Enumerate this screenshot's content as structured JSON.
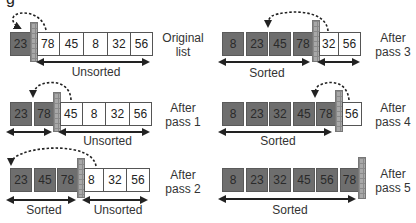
{
  "diagram": {
    "type": "selection sort passes",
    "top_clipped_text": "g",
    "rows": [
      {
        "id": "original",
        "label_line1": "Original",
        "label_line2": "list",
        "values": [
          "23",
          "78",
          "45",
          "8",
          "32",
          "56"
        ],
        "sorted_count": 1,
        "sorted_caption": "",
        "unsorted_caption": "Unsorted"
      },
      {
        "id": "pass1",
        "label_line1": "After",
        "label_line2": "pass 1",
        "values": [
          "23",
          "78",
          "45",
          "8",
          "32",
          "56"
        ],
        "sorted_count": 2,
        "sorted_caption": "",
        "unsorted_caption": "Unsorted"
      },
      {
        "id": "pass2",
        "label_line1": "After",
        "label_line2": "pass 2",
        "values": [
          "23",
          "45",
          "78",
          "8",
          "32",
          "56"
        ],
        "sorted_count": 3,
        "sorted_caption": "Sorted",
        "unsorted_caption": "Unsorted"
      },
      {
        "id": "pass3",
        "label_line1": "After",
        "label_line2": "pass 3",
        "values": [
          "8",
          "23",
          "45",
          "78",
          "32",
          "56"
        ],
        "sorted_count": 4,
        "sorted_caption": "Sorted",
        "unsorted_caption": ""
      },
      {
        "id": "pass4",
        "label_line1": "After",
        "label_line2": "pass 4",
        "values": [
          "8",
          "23",
          "32",
          "45",
          "78",
          "56"
        ],
        "sorted_count": 5,
        "sorted_caption": "Sorted",
        "unsorted_caption": ""
      },
      {
        "id": "pass5",
        "label_line1": "After",
        "label_line2": "pass 5",
        "values": [
          "8",
          "23",
          "32",
          "45",
          "56",
          "78"
        ],
        "sorted_count": 6,
        "sorted_caption": "Sorted",
        "unsorted_caption": ""
      }
    ],
    "colors": {
      "sorted_cell": "#6e6e6e",
      "unsorted_cell": "#ffffff",
      "wall": "#a8a8a8",
      "arrow": "#222222"
    }
  }
}
